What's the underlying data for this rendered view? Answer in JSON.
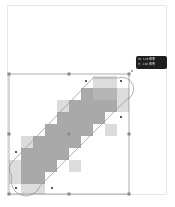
{
  "canvas": {
    "background": "#ffffff",
    "border": "#e6e6e6"
  },
  "shape": {
    "type": "pixelated-stadium",
    "fill_dark": "#a8a8a8",
    "fill_light": "#d6d6d6",
    "outline": "#8a8a8a"
  },
  "tooltip": {
    "line1": "W: 116 像素",
    "line2": "H: 116 像素",
    "background": "#1e1e1e"
  }
}
